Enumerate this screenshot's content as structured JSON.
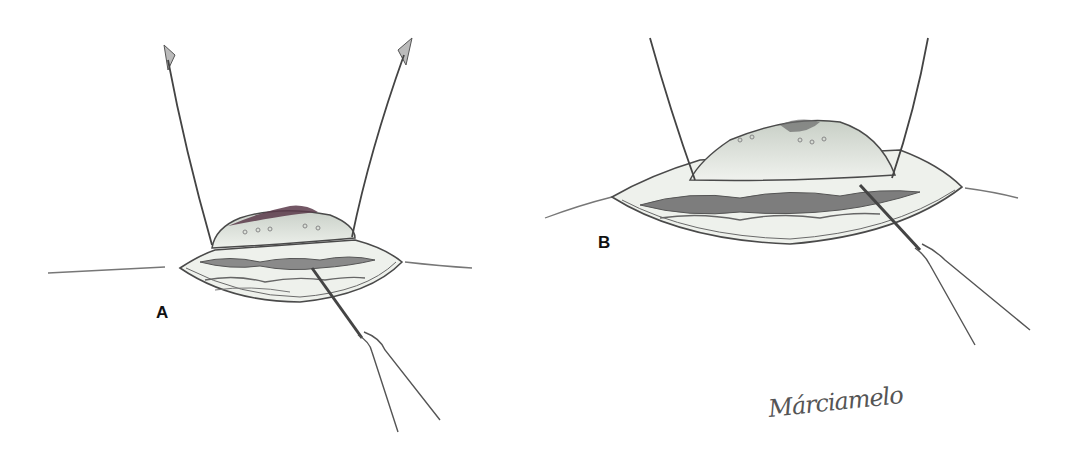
{
  "figure": {
    "panels": [
      {
        "id": "A",
        "label": "A",
        "description": "Small incision with tissue flap retracted by two hooks; dissection probe at lower right"
      },
      {
        "id": "B",
        "label": "B",
        "description": "Wider incision with larger tissue flap retracted by two hooks; dissection probe at lower right"
      }
    ],
    "signature": "Márciamelo"
  },
  "colors": {
    "background": "#ffffff",
    "line": "#4a4a4a",
    "tissue_fill": "#e8ece6",
    "flap_fill": "#d9dfd6",
    "dark_tissue": "#7a7a7a",
    "flap_center": "#5a3a4a"
  }
}
